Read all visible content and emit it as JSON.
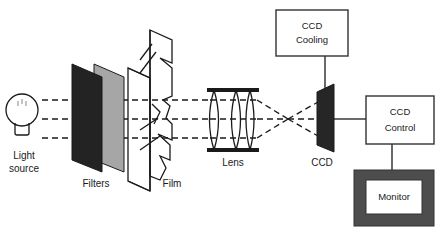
{
  "diagram": {
    "background_color": "#ffffff",
    "line_color": "#1a1a1a",
    "labels": {
      "light_source_line1": "Light",
      "light_source_line2": "source",
      "filters": "Filters",
      "film": "Film",
      "lens": "Lens",
      "ccd": "CCD"
    },
    "boxes": [
      {
        "name": "ccd-cooling",
        "line1": "CCD",
        "line2": "Cooling",
        "fill": "#ffffff",
        "stroke": "#333333"
      },
      {
        "name": "ccd-control",
        "line1": "CCD",
        "line2": "Control",
        "fill": "#ffffff",
        "stroke": "#333333"
      },
      {
        "name": "monitor",
        "line1": "Monitor",
        "bezel_fill": "#4d4d4d",
        "screen_fill": "#ffffff"
      }
    ],
    "components": {
      "light_source": {
        "name": "light-bulb",
        "fill": "#ffffff",
        "stroke": "#1a1a1a"
      },
      "filter_front": {
        "name": "dark-filter",
        "fill": "#232323"
      },
      "filter_back": {
        "name": "gray-filter",
        "fill": "#a6a6a6"
      },
      "film": {
        "name": "film-sheet",
        "fill": "#ffffff",
        "stroke": "#1a1a1a"
      },
      "lens": {
        "name": "lens-assembly",
        "element_count": 4,
        "stroke": "#1a1a1a"
      },
      "ccd_sensor": {
        "name": "ccd-sensor",
        "fill": "#262626"
      }
    },
    "rays": {
      "count": 3,
      "style": "dashed",
      "description": "three parallel dashed beams from light source through filters and film to lens, converging at focal point then diverging onto CCD"
    }
  }
}
